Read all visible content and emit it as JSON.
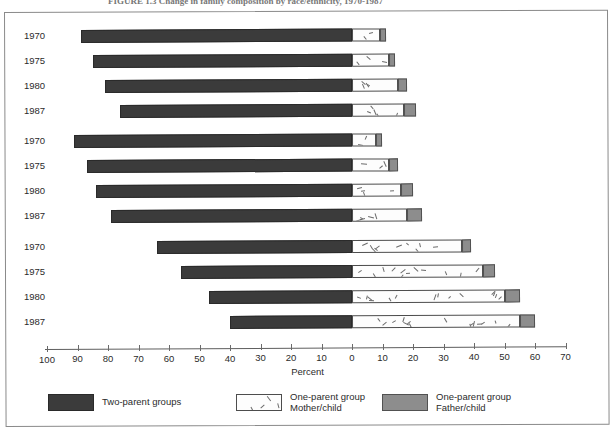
{
  "figure": {
    "caption": "FIGURE 1.3  Change in family composition by race/ethnicity, 1970-1987"
  },
  "legend": [
    {
      "key": "two_parent",
      "swatch": "dark-solid-swatch",
      "color": "#3b3b3b",
      "line1": "Two-parent groups",
      "line2": ""
    },
    {
      "key": "mother_child",
      "swatch": "white-speckled-swatch",
      "color": "#fdfdfd",
      "line1": "One-parent group",
      "line2": "Mother/child"
    },
    {
      "key": "father_child",
      "swatch": "gray-solid-swatch",
      "color": "#8d8d8d",
      "line1": "One-parent group",
      "line2": "Father/child"
    }
  ],
  "chart_data": {
    "type": "bar",
    "title": "Change in family composition by race/ethnicity, 1970-1987",
    "xlabel": "Percent",
    "ylabel": "",
    "orientation": "horizontal",
    "stacked": true,
    "diverging": true,
    "grid": false,
    "legend_position": "bottom",
    "xlim": [
      -100,
      70
    ],
    "xticks": [
      100,
      90,
      80,
      70,
      60,
      50,
      40,
      30,
      20,
      10,
      0,
      10,
      20,
      30,
      40,
      50,
      60,
      70
    ],
    "xtick_signed": [
      -100,
      -90,
      -80,
      -70,
      -60,
      -50,
      -40,
      -30,
      -20,
      -10,
      0,
      10,
      20,
      30,
      40,
      50,
      60,
      70
    ],
    "series": [
      {
        "name": "Two-parent groups",
        "side": "left"
      },
      {
        "name": "One-parent group Mother/child",
        "side": "right"
      },
      {
        "name": "One-parent group Father/child",
        "side": "right"
      }
    ],
    "groups": [
      {
        "name": "group-1",
        "rows": [
          {
            "year": "1970",
            "two_parent": 89,
            "mother_child": 9,
            "father_child": 2
          },
          {
            "year": "1975",
            "two_parent": 85,
            "mother_child": 12,
            "father_child": 2
          },
          {
            "year": "1980",
            "two_parent": 81,
            "mother_child": 15,
            "father_child": 3
          },
          {
            "year": "1987",
            "two_parent": 76,
            "mother_child": 17,
            "father_child": 4
          }
        ]
      },
      {
        "name": "group-2",
        "rows": [
          {
            "year": "1970",
            "two_parent": 91,
            "mother_child": 8,
            "father_child": 2
          },
          {
            "year": "1975",
            "two_parent": 87,
            "mother_child": 12,
            "father_child": 3
          },
          {
            "year": "1980",
            "two_parent": 84,
            "mother_child": 16,
            "father_child": 4
          },
          {
            "year": "1987",
            "two_parent": 79,
            "mother_child": 18,
            "father_child": 5
          }
        ]
      },
      {
        "name": "group-3",
        "rows": [
          {
            "year": "1970",
            "two_parent": 64,
            "mother_child": 36,
            "father_child": 3
          },
          {
            "year": "1975",
            "two_parent": 56,
            "mother_child": 43,
            "father_child": 4
          },
          {
            "year": "1980",
            "two_parent": 47,
            "mother_child": 50,
            "father_child": 5
          },
          {
            "year": "1987",
            "two_parent": 40,
            "mother_child": 55,
            "father_child": 5
          }
        ]
      }
    ]
  }
}
